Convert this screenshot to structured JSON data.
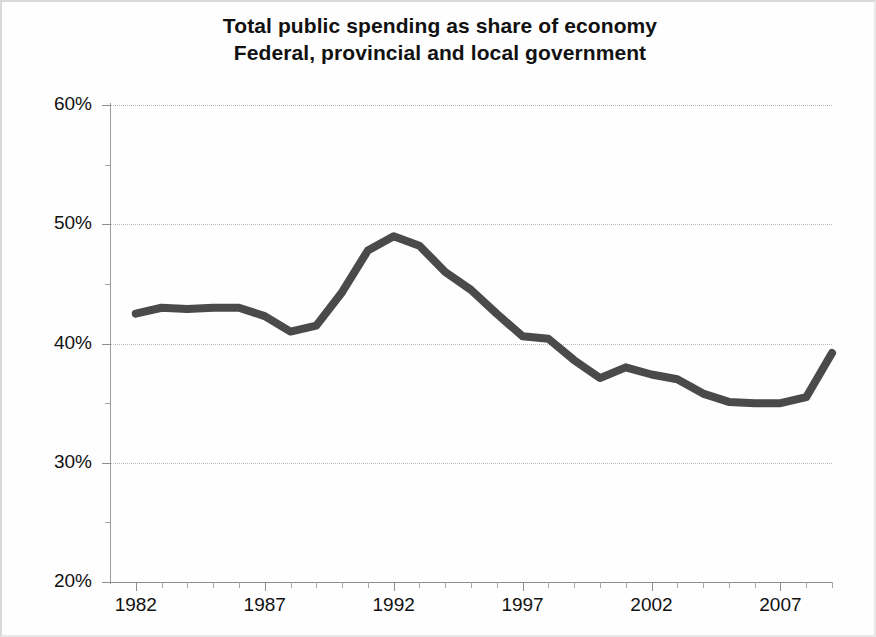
{
  "chart_data": {
    "type": "line",
    "title": "Total public spending as share of economy",
    "subtitle": "Federal, provincial and local government",
    "xlabel": "",
    "ylabel": "",
    "xlim": [
      1981,
      2009
    ],
    "ylim": [
      20,
      60
    ],
    "y_tick_values": [
      20,
      30,
      40,
      50,
      60
    ],
    "y_tick_labels": [
      "20%",
      "30%",
      "40%",
      "50%",
      "60%"
    ],
    "y_minor_tick_values": [
      25,
      35,
      45,
      55
    ],
    "x_tick_values": [
      1982,
      1987,
      1992,
      1997,
      2002,
      2007
    ],
    "x_tick_labels": [
      "1982",
      "1987",
      "1992",
      "1997",
      "2002",
      "2007"
    ],
    "x_minor_tick_values": [
      1983,
      1984,
      1985,
      1986,
      1988,
      1989,
      1990,
      1991,
      1993,
      1994,
      1995,
      1996,
      1998,
      1999,
      2000,
      2001,
      2003,
      2004,
      2005,
      2006,
      2008,
      2009
    ],
    "grid": "horizontal-dotted",
    "legend": "none",
    "line_color": "#4a4a4a",
    "line_width": 8,
    "units": "percent of GDP",
    "series": [
      {
        "name": "Total public spending as share of economy",
        "x": [
          1982,
          1983,
          1984,
          1985,
          1986,
          1987,
          1988,
          1989,
          1990,
          1991,
          1992,
          1993,
          1994,
          1995,
          1996,
          1997,
          1998,
          1999,
          2000,
          2001,
          2002,
          2003,
          2004,
          2005,
          2006,
          2007,
          2008,
          2009
        ],
        "values": [
          42.5,
          43.0,
          42.9,
          43.0,
          43.0,
          42.3,
          41.0,
          41.5,
          44.3,
          47.8,
          49.0,
          48.2,
          46.0,
          44.5,
          42.5,
          40.6,
          40.4,
          38.6,
          37.1,
          38.0,
          37.4,
          37.0,
          35.8,
          35.1,
          35.0,
          35.0,
          35.5,
          39.2
        ]
      }
    ]
  },
  "figure": {
    "background_color": "#ffffff",
    "border_color": "#d9d9d9"
  }
}
